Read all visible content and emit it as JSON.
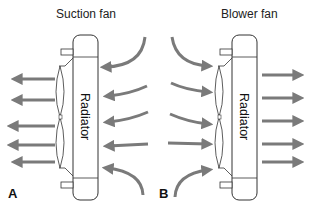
{
  "panels": [
    {
      "id": "A",
      "title": "Suction fan",
      "label": "A",
      "component_label": "Radiator",
      "airflow": "right-to-left (air pulled through radiator by fan on left side)"
    },
    {
      "id": "B",
      "title": "Blower fan",
      "label": "B",
      "component_label": "Radiator",
      "airflow": "left-to-right (air pushed through radiator by fan on left side)"
    }
  ],
  "colors": {
    "arrow": "#7a7a7a",
    "outline": "#333333",
    "text": "#222222",
    "background": "#ffffff"
  }
}
